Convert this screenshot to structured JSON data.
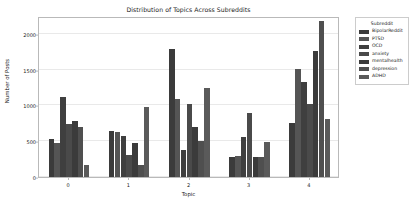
{
  "chart_data": {
    "type": "bar",
    "title": "Distribution of Topics Across Subreddits",
    "xlabel": "Topic",
    "ylabel": "Number of Posts",
    "categories": [
      "0",
      "1",
      "2",
      "3",
      "4"
    ],
    "yticks": [
      0,
      500,
      1000,
      1500,
      2000
    ],
    "ylim": [
      0,
      2250
    ],
    "grid": true,
    "legend_position": "right-outside",
    "legend_title": "Subreddit",
    "series": [
      {
        "name": "BipolarReddit",
        "color": "#3b3b3b",
        "values": [
          530,
          650,
          1790,
          280,
          755
        ]
      },
      {
        "name": "PTSD",
        "color": "#555555",
        "values": [
          470,
          625,
          1090,
          295,
          1505
        ]
      },
      {
        "name": "OCD",
        "color": "#3f3f3f",
        "values": [
          1120,
          580,
          375,
          560,
          1330
        ]
      },
      {
        "name": "anxiety",
        "color": "#4a4a4a",
        "values": [
          745,
          310,
          1025,
          890,
          1015
        ]
      },
      {
        "name": "mentalhealth",
        "color": "#3b3b3b",
        "values": [
          780,
          475,
          700,
          275,
          1755
        ]
      },
      {
        "name": "depression",
        "color": "#4f4f4f",
        "values": [
          705,
          170,
          505,
          275,
          2185
        ]
      },
      {
        "name": "ADHD",
        "color": "#5a5a5a",
        "values": [
          165,
          980,
          1245,
          495,
          815
        ]
      }
    ]
  }
}
